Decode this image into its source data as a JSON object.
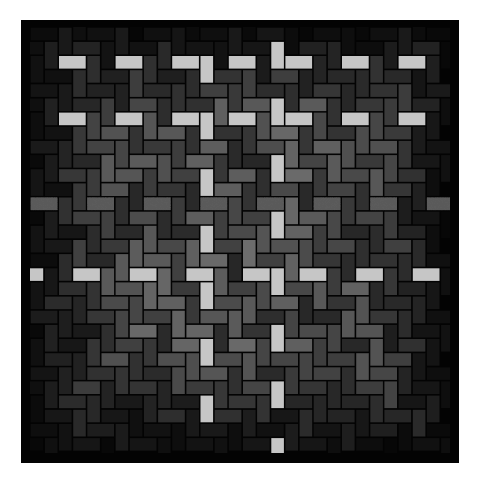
{
  "figure": {
    "description": "Herringbone brick pattern in grey tones on a black square",
    "canvas": {
      "width": 482,
      "height": 481,
      "background": "#ffffff"
    },
    "frame": {
      "x": 21,
      "y": 20,
      "width": 438,
      "height": 443,
      "color": "#030303"
    },
    "grid": {
      "origin_x": 59,
      "origin_y": 56,
      "unit": 14.15,
      "gap": 1.6,
      "col_range": [
        -3,
        28
      ],
      "row_range": [
        -3,
        29
      ],
      "tile_size": 4,
      "tile_bricks": [
        {
          "orient": "H",
          "col": 0,
          "row": 0
        },
        {
          "orient": "V",
          "col": 2,
          "row": 0
        },
        {
          "orient": "V",
          "col": 1,
          "row": 1
        },
        {
          "orient": "H",
          "col": 3,
          "row": 1
        },
        {
          "orient": "H",
          "col": 2,
          "row": 2
        },
        {
          "orient": "V",
          "col": 0,
          "row": 2
        },
        {
          "orient": "H",
          "col": 1,
          "row": 3
        },
        {
          "orient": "V",
          "col": 3,
          "row": 3
        }
      ]
    },
    "shading": {
      "bright_color": "#c6c6c6",
      "bright_rules": [
        {
          "orient": "H",
          "rows": [
            0,
            4
          ],
          "col_mod": 0
        },
        {
          "orient": "H",
          "rows": [
            15
          ],
          "col_mod": 1
        },
        {
          "orient": "V",
          "cols": [
            10
          ],
          "row_min": -1,
          "row_max": 27
        },
        {
          "orient": "V",
          "cols": [
            15
          ],
          "row_min": -1,
          "row_max": 27
        }
      ],
      "speckled_rows": [
        10
      ],
      "speckled_color": "#5a5a5a",
      "base_min": 38,
      "base_max": 108,
      "edge_fade_start": 0.55,
      "content_bounds": {
        "x0": 30,
        "y0": 27,
        "x1": 450,
        "y1": 453
      }
    }
  }
}
